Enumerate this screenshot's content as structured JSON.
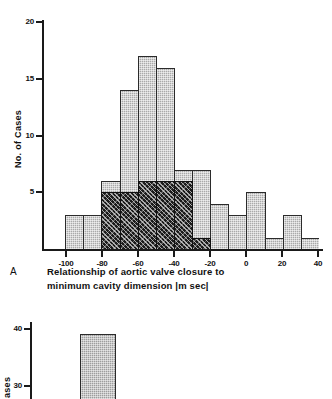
{
  "figure": {
    "panel_a_letter": "A",
    "caption_line1": "Relationship of aortic valve closure to",
    "caption_line2": "minimum cavity dimension   |m sec|"
  },
  "panel_a": {
    "ylabel": "No.  of  Cases",
    "ytick_labels": [
      "5",
      "10",
      "15",
      "20"
    ],
    "xtick_labels": [
      "-100",
      "-80",
      "-60",
      "-40",
      "-20",
      "0",
      "20",
      "40"
    ]
  },
  "panel_b": {
    "ylabel": "ases",
    "ytick_labels": [
      "30",
      "40"
    ]
  },
  "chart_data": [
    {
      "type": "bar",
      "title": "",
      "subtitle": "",
      "panel": "A",
      "xlabel": "Relationship of aortic valve closure to minimum cavity dimension |m sec|",
      "ylabel": "No. of Cases",
      "xlim": [
        -110,
        40
      ],
      "ylim": [
        0,
        21
      ],
      "xticks": [
        -100,
        -80,
        -60,
        -40,
        -20,
        0,
        20,
        40
      ],
      "yticks": [
        5,
        10,
        15,
        20
      ],
      "grid": false,
      "legend": "none",
      "bin_width": 10,
      "bin_starts": [
        -110,
        -100,
        -90,
        -80,
        -70,
        -60,
        -50,
        -40,
        -30,
        -20,
        -10,
        0,
        10,
        20,
        30
      ],
      "series": [
        {
          "name": "All cases (light hatched)",
          "color": "#a9a9a9",
          "bins": [
            {
              "x0": -110,
              "x1": -100,
              "value": 0
            },
            {
              "x0": -100,
              "x1": -90,
              "value": 3
            },
            {
              "x0": -90,
              "x1": -80,
              "value": 3
            },
            {
              "x0": -80,
              "x1": -70,
              "value": 6
            },
            {
              "x0": -70,
              "x1": -60,
              "value": 14
            },
            {
              "x0": -60,
              "x1": -50,
              "value": 17
            },
            {
              "x0": -50,
              "x1": -40,
              "value": 16
            },
            {
              "x0": -40,
              "x1": -30,
              "value": 7
            },
            {
              "x0": -30,
              "x1": -20,
              "value": 7
            },
            {
              "x0": -20,
              "x1": -10,
              "value": 4
            },
            {
              "x0": -10,
              "x1": 0,
              "value": 3
            },
            {
              "x0": 0,
              "x1": 10,
              "value": 5
            },
            {
              "x0": 10,
              "x1": 20,
              "value": 1
            },
            {
              "x0": 20,
              "x1": 30,
              "value": 3
            },
            {
              "x0": 30,
              "x1": 40,
              "value": 1
            }
          ]
        },
        {
          "name": "Subgroup (dark speckled overlay)",
          "color": "#1b1b1b",
          "bins": [
            {
              "x0": -80,
              "x1": -70,
              "value": 5
            },
            {
              "x0": -70,
              "x1": -60,
              "value": 5
            },
            {
              "x0": -60,
              "x1": -50,
              "value": 6
            },
            {
              "x0": -50,
              "x1": -40,
              "value": 6
            },
            {
              "x0": -40,
              "x1": -30,
              "value": 6
            },
            {
              "x0": -30,
              "x1": -20,
              "value": 1
            }
          ]
        }
      ]
    },
    {
      "type": "bar",
      "panel": "B",
      "title": "",
      "note": "Lower panel is cropped at the bottom edge of the image",
      "xlabel": "",
      "ylabel": "ases",
      "ylim": [
        25,
        44
      ],
      "yticks": [
        30,
        40
      ],
      "grid": false,
      "legend": "none",
      "series": [
        {
          "name": "Cases",
          "color": "#9d9d9d",
          "bins": [
            {
              "x0": 0,
              "x1": 1,
              "value": 38
            }
          ]
        }
      ]
    }
  ]
}
